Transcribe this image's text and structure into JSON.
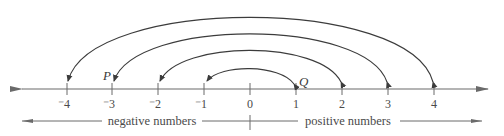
{
  "diagram": {
    "type": "number-line",
    "colors": {
      "line": "#6a6a6a",
      "arc": "#3c3c3c",
      "text": "#4a4a4a"
    },
    "ticks": [
      {
        "value": -4,
        "label": "⁻4"
      },
      {
        "value": -3,
        "label": "⁻3"
      },
      {
        "value": -2,
        "label": "⁻2"
      },
      {
        "value": -1,
        "label": "⁻1"
      },
      {
        "value": 0,
        "label": "0"
      },
      {
        "value": 1,
        "label": "1"
      },
      {
        "value": 2,
        "label": "2"
      },
      {
        "value": 3,
        "label": "3"
      },
      {
        "value": 4,
        "label": "4"
      }
    ],
    "points": [
      {
        "label": "P",
        "at": -3
      },
      {
        "label": "Q",
        "at": 1
      }
    ],
    "arcs": [
      {
        "from": -1,
        "to": 1,
        "arrowheads": "both"
      },
      {
        "from": 2,
        "to": -2,
        "arrowheads": "both"
      },
      {
        "from": 3,
        "to": -3,
        "arrowheads": "both"
      },
      {
        "from": 4,
        "to": -4,
        "arrowheads": "both"
      }
    ],
    "regions": {
      "negative": "negative numbers",
      "positive": "positive numbers"
    }
  }
}
